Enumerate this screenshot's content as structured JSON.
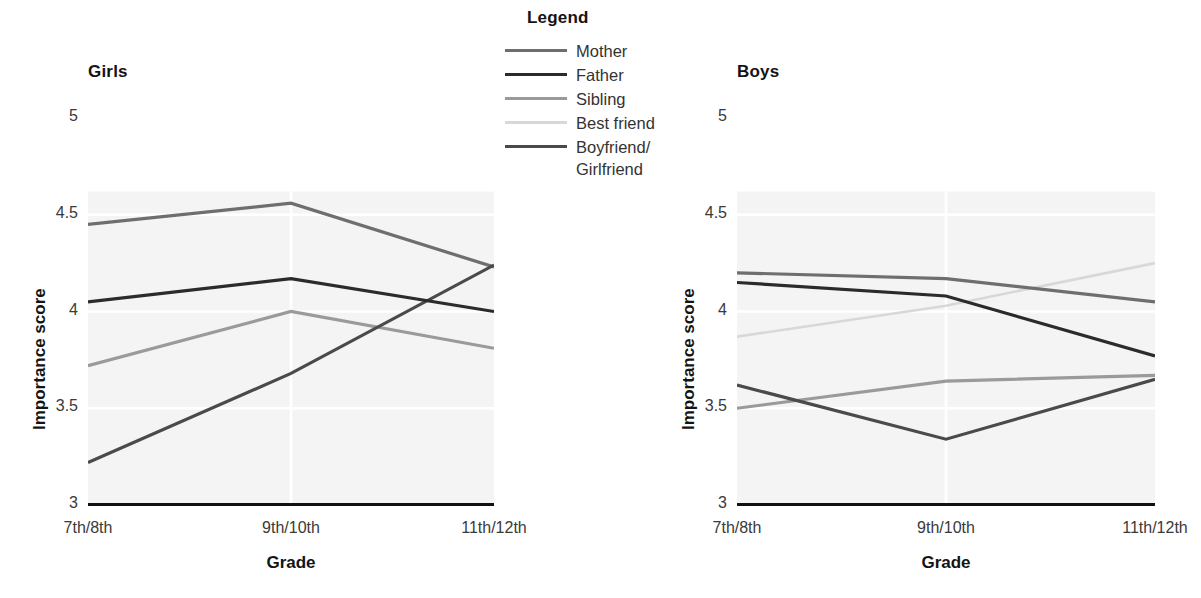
{
  "legend": {
    "title": "Legend",
    "entries": [
      {
        "label": "Mother",
        "color": "#6e6e6e",
        "width": 3.0,
        "key": "mother"
      },
      {
        "label": "Father",
        "color": "#2b2b2b",
        "width": 3.4,
        "key": "father"
      },
      {
        "label": "Sibling",
        "color": "#9a9a9a",
        "width": 3.2,
        "key": "sibling"
      },
      {
        "label": "Best friend",
        "color": "#d8d8d8",
        "width": 2.6,
        "key": "best_friend"
      },
      {
        "label": "Boyfriend/\nGirlfriend",
        "color": "#4a4a4a",
        "width": 3.2,
        "key": "partner"
      }
    ]
  },
  "chart_data": [
    {
      "type": "line",
      "title": "Girls",
      "xlabel": "Grade",
      "ylabel": "Importance score",
      "categories": [
        "7th/8th",
        "9th/10th",
        "11th/12th"
      ],
      "ylim": [
        3,
        5
      ],
      "yticks": [
        3,
        3.5,
        4,
        4.5,
        5
      ],
      "ytick_labels": [
        "3",
        "3.5",
        "4",
        "4.5",
        "5"
      ],
      "grid": "horizontal-light",
      "legend_position": "center-top-external",
      "series": [
        {
          "name": "Mother",
          "color": "#6e6e6e",
          "values": [
            4.45,
            4.56,
            4.23
          ]
        },
        {
          "name": "Father",
          "color": "#2b2b2b",
          "values": [
            4.05,
            4.17,
            4.0
          ]
        },
        {
          "name": "Sibling",
          "color": "#9a9a9a",
          "values": [
            3.72,
            4.0,
            3.81
          ]
        },
        {
          "name": "Boyfriend/Girlfriend",
          "color": "#4a4a4a",
          "values": [
            3.22,
            3.68,
            4.24
          ]
        }
      ]
    },
    {
      "type": "line",
      "title": "Boys",
      "xlabel": "Grade",
      "ylabel": "Importance score",
      "categories": [
        "7th/8th",
        "9th/10th",
        "11th/12th"
      ],
      "ylim": [
        3,
        5
      ],
      "yticks": [
        3,
        3.5,
        4,
        4.5,
        5
      ],
      "ytick_labels": [
        "3",
        "3.5",
        "4",
        "4.5",
        "5"
      ],
      "grid": "horizontal-light",
      "legend_position": "center-top-external",
      "series": [
        {
          "name": "Mother",
          "color": "#6e6e6e",
          "values": [
            4.2,
            4.17,
            4.05
          ]
        },
        {
          "name": "Father",
          "color": "#2b2b2b",
          "values": [
            4.15,
            4.08,
            3.77
          ]
        },
        {
          "name": "Sibling",
          "color": "#9a9a9a",
          "values": [
            3.5,
            3.64,
            3.67
          ]
        },
        {
          "name": "Best friend",
          "color": "#d8d8d8",
          "values": [
            3.87,
            4.03,
            4.25
          ]
        },
        {
          "name": "Boyfriend/Girlfriend",
          "color": "#4a4a4a",
          "values": [
            3.62,
            3.34,
            3.65
          ]
        }
      ]
    }
  ]
}
